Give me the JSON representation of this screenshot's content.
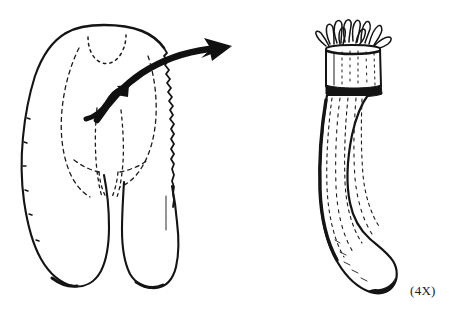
{
  "figure": {
    "kind": "scientific-line-drawing",
    "medium": "black-ink-line-art",
    "background_color": "#ffffff",
    "ink_color": "#111111",
    "width": 449,
    "height": 317,
    "title": "",
    "caption": "",
    "annotations": {
      "scale_label": "(4X)"
    },
    "parts": [
      {
        "id": "left-specimen",
        "name": "bilobed-structure",
        "description": "Broad bilobed organ, outline in solid ink, left margin smooth, right margin finely serrated, interior marked with dashed contour lines, two rounded lobes descending at the base and a dotted U-shaped notch at the apex.",
        "bbox": [
          18,
          24,
          182,
          288
        ],
        "outline_style": "solid",
        "interior_style": "dashed"
      },
      {
        "id": "callout-arrow",
        "name": "large-curved-arrow",
        "description": "Thick curved black arrow sweeping from the interior of the left specimen up and to the right, ending in a barbed arrowhead.",
        "bbox": [
          95,
          34,
          235,
          122
        ],
        "direction": "right"
      },
      {
        "id": "inner-arrow",
        "name": "small-hook-arrow",
        "description": "Small hooked black arrow inside the left specimen pointing up and to the right.",
        "bbox": [
          82,
          84,
          132,
          122
        ],
        "direction": "up-right"
      },
      {
        "id": "right-specimen",
        "name": "elongated-cylindrical-structure",
        "description": "Slender elongated cylindrical body curving gently to the right, finely striated lengthwise, crowned at the top by a ring of finger-like tentacle projections above a dark collar band, terminating in a rounded tip.",
        "bbox": [
          315,
          18,
          402,
          296
        ],
        "magnification": "(4X)",
        "features": [
          "tentacle-crown",
          "collar-band",
          "longitudinal-striations",
          "rounded-tip"
        ]
      }
    ]
  }
}
